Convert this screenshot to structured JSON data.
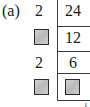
{
  "label": "(a)",
  "division_ladder": {
    "divisors": [
      "2",
      "",
      "2",
      ""
    ],
    "divisor_blank": [
      false,
      true,
      false,
      true
    ],
    "quotients": [
      "24",
      "12",
      "6",
      ""
    ],
    "quotient_blank": [
      false,
      false,
      false,
      true
    ],
    "bottom_value": "1"
  },
  "colors": {
    "blank_box_fill": "#c4c4c4",
    "blank_box_border": "#2a2a2a",
    "line": "#3a3a3a",
    "text": "#1a1a1a"
  }
}
